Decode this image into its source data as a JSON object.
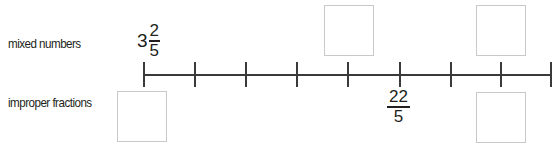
{
  "rows": {
    "mixed_label": "mixed numbers",
    "improper_label": "improper fractions"
  },
  "number_line": {
    "tick_count": 9,
    "tick_spacing_px": 51,
    "line_color": "#3a3a3a"
  },
  "given_values": {
    "mixed_at_tick_0": {
      "whole": "3",
      "numerator": "2",
      "denominator": "5"
    },
    "improper_at_tick_5": {
      "numerator": "22",
      "denominator": "5"
    }
  },
  "answer_boxes": [
    {
      "row": "mixed numbers",
      "tick_index": 4,
      "value": ""
    },
    {
      "row": "mixed numbers",
      "tick_index": 7,
      "value": ""
    },
    {
      "row": "improper fractions",
      "tick_index": 0,
      "value": ""
    },
    {
      "row": "improper fractions",
      "tick_index": 7,
      "value": ""
    }
  ],
  "colors": {
    "box_border": "#c9c9c9",
    "text": "#231f20"
  }
}
